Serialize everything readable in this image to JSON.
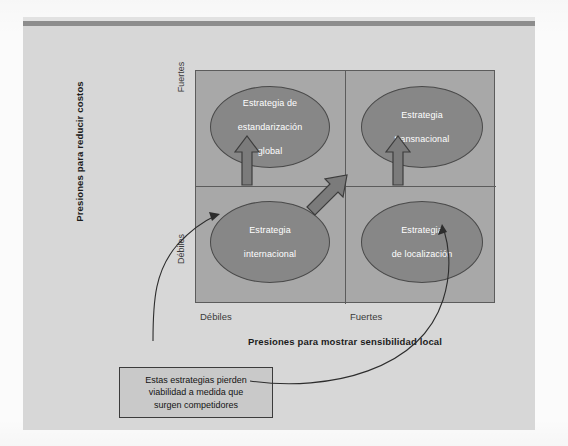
{
  "diagram": {
    "type": "2x2-strategy-matrix",
    "y_axis": {
      "title": "Presiones para reducir costos",
      "high_label": "Fuertes",
      "low_label": "Débiles"
    },
    "x_axis": {
      "title": "Presiones para mostrar sensibilidad local",
      "low_label": "Débiles",
      "high_label": "Fuertes"
    },
    "quadrants": [
      {
        "id": "top-left",
        "label": "Estrategia de\nestandarización\nglobal",
        "line1": "Estrategia de",
        "line2": "estandarización",
        "line3": "global"
      },
      {
        "id": "top-right",
        "label": "Estrategia\ntransnacional",
        "line1": "Estrategia",
        "line2": "transnacional",
        "line3": ""
      },
      {
        "id": "bottom-left",
        "label": "Estrategia\ninternacional",
        "line1": "Estrategia",
        "line2": "internacional",
        "line3": ""
      },
      {
        "id": "bottom-right",
        "label": "Estrategia\nde localización",
        "line1": "Estrategia",
        "line2": "de localización",
        "line3": ""
      }
    ],
    "arrows": [
      {
        "id": "arrow-international-to-global",
        "from": "bottom-left",
        "to": "top-left",
        "direction": "up"
      },
      {
        "id": "arrow-international-to-transnational",
        "from": "bottom-left",
        "to": "top-right",
        "direction": "diagonal-up-right"
      },
      {
        "id": "arrow-localization-to-transnational",
        "from": "bottom-right",
        "to": "top-right",
        "direction": "up"
      }
    ],
    "callout": {
      "line1": "Estas estrategias pierden",
      "line2": "viabilidad a medida que",
      "line3": "surgen competidores",
      "points_to": [
        "bottom-left",
        "bottom-right"
      ]
    },
    "colors": {
      "panel_background": "#d7d7d7",
      "matrix_fill": "#a8a8a8",
      "ellipse_fill": "#878787",
      "ellipse_text": "#ffffff",
      "line": "#3b3b3b",
      "callout_fill": "#c9c9c9",
      "rule_dark": "#8d8d8d"
    }
  }
}
